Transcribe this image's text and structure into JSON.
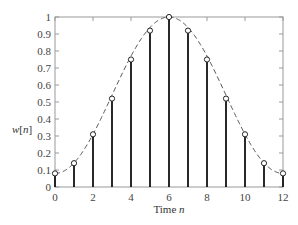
{
  "chart_data": {
    "type": "stem",
    "title": "",
    "xlabel": "Time n",
    "xlabel_parts": {
      "text": "Time ",
      "var": "n"
    },
    "ylabel": "w[n]",
    "ylabel_parts": {
      "var": "w",
      "bracket": "[n]"
    },
    "xlim": [
      0,
      12
    ],
    "ylim": [
      0,
      1
    ],
    "xticks": [
      0,
      2,
      4,
      6,
      8,
      10,
      12
    ],
    "xtick_minor": [
      1,
      3,
      5,
      7,
      9,
      11
    ],
    "yticks": [
      0,
      0.1,
      0.2,
      0.3,
      0.4,
      0.5,
      0.6,
      0.7,
      0.8,
      0.9,
      1
    ],
    "ytick_labels": [
      "0",
      "0.1",
      "0.2",
      "0.3",
      "0.4",
      "0.5",
      "0.6",
      "0.7",
      "0.8",
      "0.9",
      "1"
    ],
    "grid": false,
    "legend": null,
    "series": [
      {
        "name": "w[n] samples",
        "style": "stem with open circle markers",
        "x": [
          0,
          1,
          2,
          3,
          4,
          5,
          6,
          7,
          8,
          9,
          10,
          11,
          12
        ],
        "values": [
          0.08,
          0.14,
          0.31,
          0.52,
          0.75,
          0.92,
          1.0,
          0.92,
          0.75,
          0.52,
          0.31,
          0.14,
          0.08
        ]
      },
      {
        "name": "continuous envelope",
        "style": "dashed line",
        "function": "0.54 - 0.46*cos(2*pi*t/12)"
      }
    ]
  }
}
